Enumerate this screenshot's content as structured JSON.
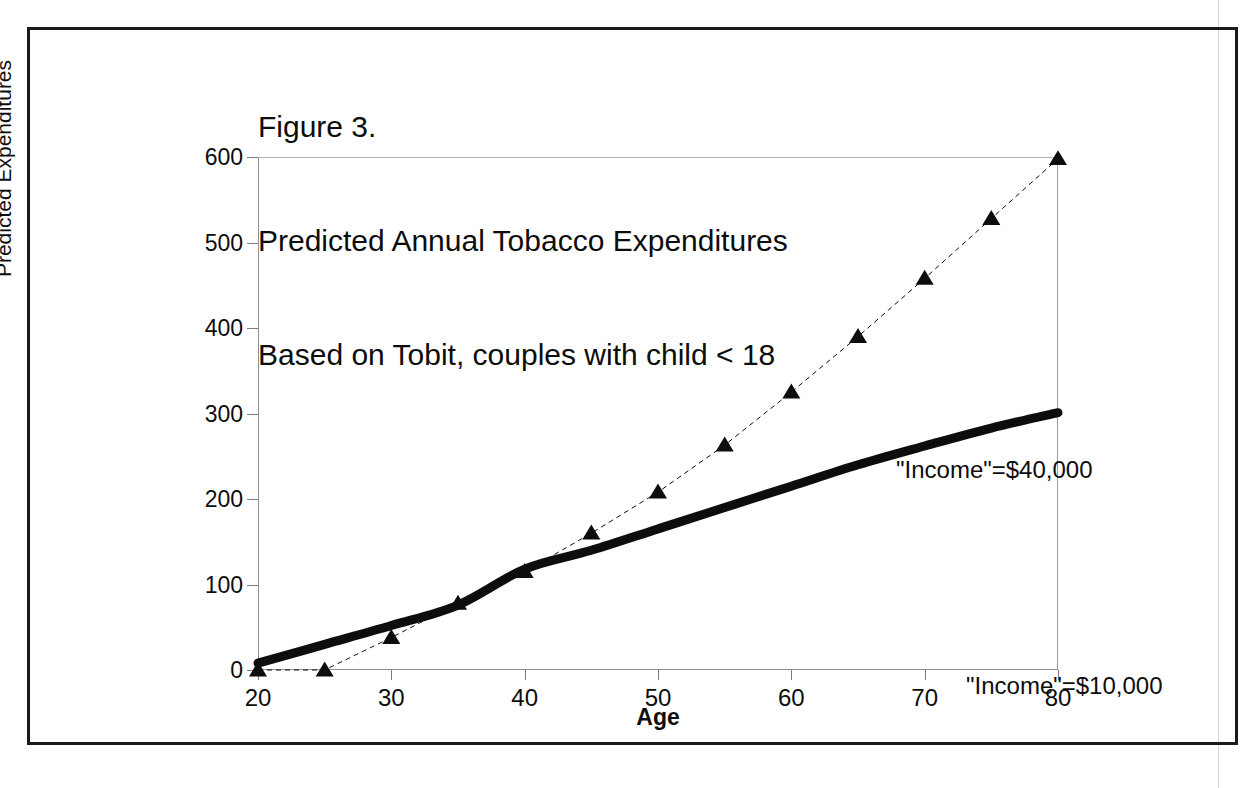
{
  "figure": {
    "title_lines": [
      "Figure 3.",
      "Predicted Annual Tobacco Expenditures",
      "Based on Tobit, couples with child < 18"
    ],
    "title_full": "Figure 3. Predicted Annual Tobacco Expenditures Based on Tobit, couples with child < 18"
  },
  "colors": {
    "ink": "#0d0d0d",
    "frame": "#1a1a1a",
    "axis": "#8e8e8e",
    "series_solid": "#0d0d0d",
    "series_dashed": "#0d0d0d"
  },
  "chart_data": {
    "type": "line",
    "title": "Figure 3. Predicted Annual Tobacco Expenditures Based on Tobit, couples with child < 18",
    "subtitle": "Based on Tobit, couples with child < 18",
    "xlabel": "Age",
    "ylabel": "Predicted Expenditures",
    "xlim": [
      20,
      80
    ],
    "ylim": [
      0,
      600
    ],
    "xticks": [
      20,
      30,
      40,
      50,
      60,
      70,
      80
    ],
    "yticks": [
      0,
      100,
      200,
      300,
      400,
      500,
      600
    ],
    "xtick_labels": [
      "20",
      "30",
      "40",
      "50",
      "60",
      "70",
      "80"
    ],
    "ytick_labels": [
      "0",
      "100",
      "200",
      "300",
      "400",
      "500",
      "600"
    ],
    "grid": false,
    "legend": "none",
    "annotations": [
      {
        "text": "\"Income\"=$40,000",
        "x": 52,
        "y": 425,
        "series": "income-40000"
      },
      {
        "text": "\"Income\"=$10,000",
        "x": 57,
        "y": 185,
        "series": "income-10000"
      }
    ],
    "x": [
      20,
      25,
      30,
      35,
      40,
      45,
      50,
      55,
      60,
      65,
      70,
      75,
      80
    ],
    "series": [
      {
        "name": "\"Income\"=$40,000",
        "style": "dashed",
        "marker": "triangle",
        "linewidth": 1,
        "values": [
          0,
          0,
          38,
          78,
          115,
          160,
          208,
          263,
          325,
          390,
          458,
          528,
          598
        ]
      },
      {
        "name": "\"Income\"=$10,000",
        "style": "solid-thick",
        "marker": "none",
        "linewidth": 9,
        "values": [
          8,
          30,
          52,
          76,
          118,
          140,
          165,
          190,
          215,
          240,
          262,
          283,
          301
        ]
      }
    ]
  }
}
